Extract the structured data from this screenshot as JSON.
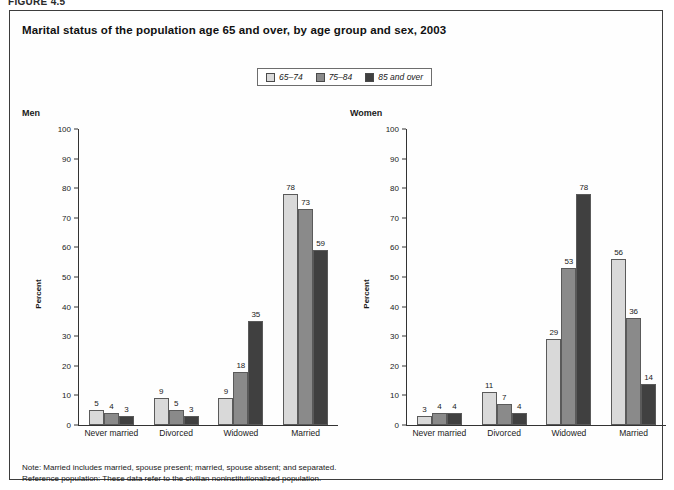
{
  "figure_label": "FIGURE 4.5",
  "title": "Marital status of the population age 65 and over, by age group and sex, 2003",
  "legend": {
    "items": [
      {
        "label": "65–74",
        "color": "#d9d9d9"
      },
      {
        "label": "75–84",
        "color": "#8a8a8a"
      },
      {
        "label": "85 and over",
        "color": "#404040"
      }
    ]
  },
  "panels": [
    {
      "heading": "Men"
    },
    {
      "heading": "Women"
    }
  ],
  "notes": [
    "Note: Married includes married, spouse present; married, spouse absent; and separated.",
    "Reference population: These data refer to the civilian noninstitutionalized population."
  ],
  "chart_data": [
    {
      "type": "bar",
      "title": "Men",
      "xlabel": "",
      "ylabel": "Percent",
      "ylim": [
        0,
        100
      ],
      "yticks": [
        0,
        10,
        20,
        30,
        40,
        50,
        60,
        70,
        80,
        90,
        100
      ],
      "grid": false,
      "legend_position": "top-center",
      "categories": [
        "Never married",
        "Divorced",
        "Widowed",
        "Married"
      ],
      "series": [
        {
          "name": "65–74",
          "values": [
            5,
            9,
            9,
            78
          ]
        },
        {
          "name": "75–84",
          "values": [
            4,
            5,
            18,
            73
          ]
        },
        {
          "name": "85 and over",
          "values": [
            3,
            3,
            35,
            59
          ]
        }
      ]
    },
    {
      "type": "bar",
      "title": "Women",
      "xlabel": "",
      "ylabel": "Percent",
      "ylim": [
        0,
        100
      ],
      "yticks": [
        0,
        10,
        20,
        30,
        40,
        50,
        60,
        70,
        80,
        90,
        100
      ],
      "grid": false,
      "legend_position": "top-center",
      "categories": [
        "Never married",
        "Divorced",
        "Widowed",
        "Married"
      ],
      "series": [
        {
          "name": "65–74",
          "values": [
            3,
            11,
            29,
            56
          ]
        },
        {
          "name": "75–84",
          "values": [
            4,
            7,
            53,
            36
          ]
        },
        {
          "name": "85 and over",
          "values": [
            4,
            4,
            78,
            14
          ]
        }
      ]
    }
  ]
}
